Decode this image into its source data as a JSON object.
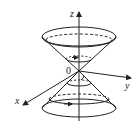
{
  "diagram": {
    "axes": {
      "z_label": "z",
      "y_label": "y",
      "x_label": "x",
      "origin_label": "0"
    },
    "colors": {
      "stroke": "#222222",
      "background": "#ffffff"
    },
    "shapes": [
      "upper-cone",
      "lower-cone",
      "upper-rim-ellipse",
      "lower-rim-ellipse",
      "upper-inner-circle-with-arrow",
      "lower-inner-circle-with-arrow"
    ]
  }
}
